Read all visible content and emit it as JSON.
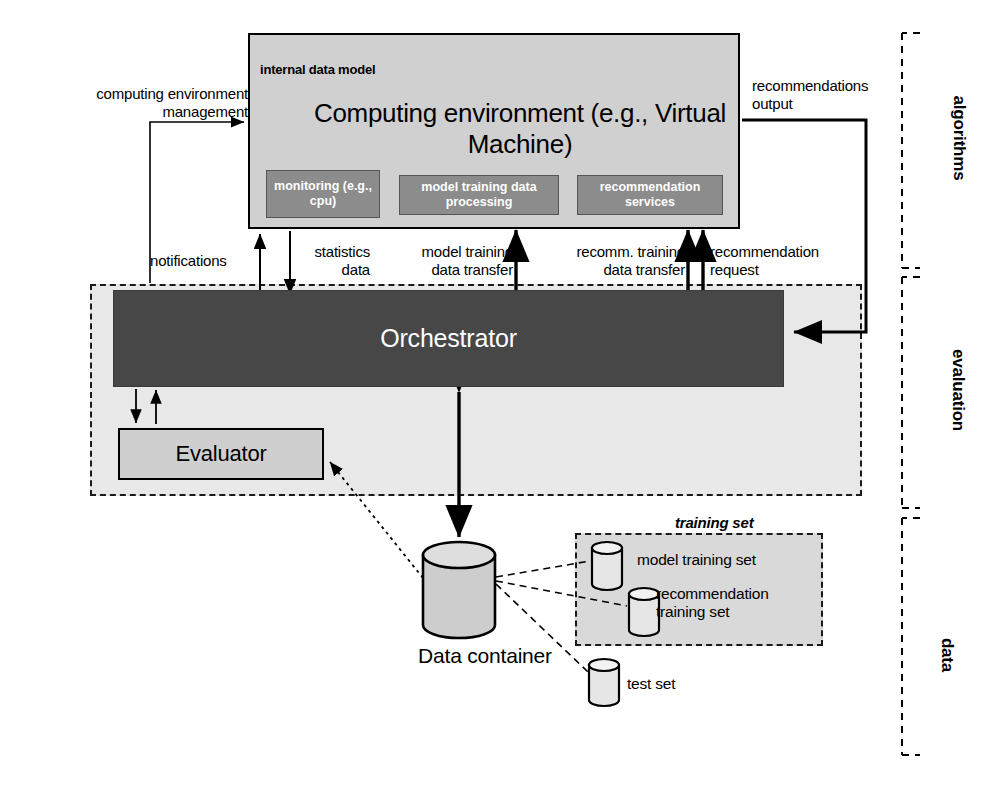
{
  "diagram": {
    "compute_env": {
      "title": "Computing environment\n(e.g., Virtual Machine)",
      "internal_data_model_label": "internal data model",
      "services": [
        {
          "name": "monitoring-service",
          "label": "monitoring\n(e.g., cpu)"
        },
        {
          "name": "model-training-service",
          "label": "model training data\nprocessing"
        },
        {
          "name": "recommendation-service",
          "label": "recommendation\nservices"
        }
      ]
    },
    "orchestrator": {
      "label": "Orchestrator"
    },
    "evaluator": {
      "label": "Evaluator"
    },
    "data_container": {
      "label": "Data container"
    },
    "training_set_group": {
      "title": "training set",
      "items": [
        {
          "name": "model-training-set",
          "label": "model training set"
        },
        {
          "name": "recommendation-training-set",
          "label": "recommendation\ntraining set"
        }
      ]
    },
    "test_set": {
      "label": "test set"
    },
    "edge_labels": {
      "computing_environment_management": "computing environment\nmanagement",
      "notifications": "notifications",
      "statistics_data": "statistics\ndata",
      "model_training_data_transfer": "model training\ndata transfer",
      "recomm_training_data_transfer": "recomm. training\ndata transfer",
      "recommendation_request": "recommendation\nrequest",
      "recommendations_output": "recommendations\noutput"
    },
    "sections": [
      {
        "name": "algorithms",
        "label": "algorithms"
      },
      {
        "name": "evaluation",
        "label": "evaluation"
      },
      {
        "name": "data",
        "label": "data"
      }
    ],
    "colors": {
      "compute_env_fill": "#d0d0d0",
      "service_fill": "#8c8c8c",
      "orchestrator_fill": "#474747",
      "evaluator_fill": "#cfcfcf",
      "evaluation_region_fill": "#e8e8e8",
      "training_region_fill": "#d9d9d9",
      "cylinder_dark_fill": "#8c8c8c",
      "cylinder_light_fill": "#d8d8d8",
      "stroke": "#000000"
    }
  }
}
